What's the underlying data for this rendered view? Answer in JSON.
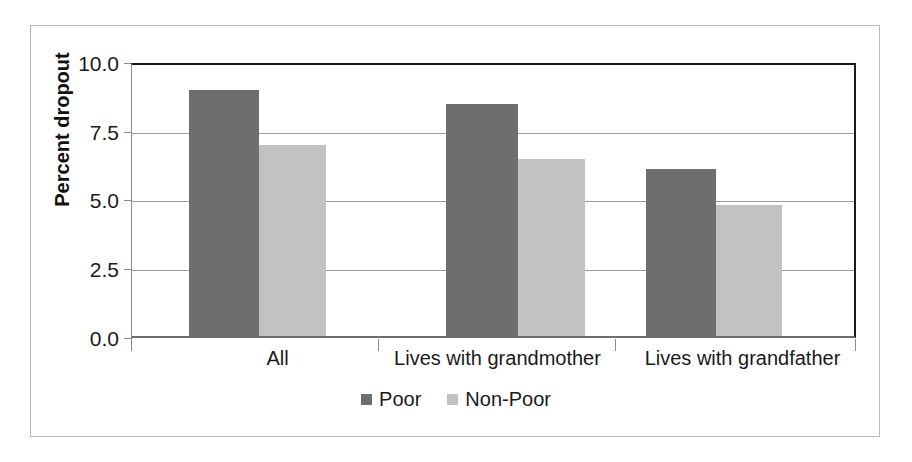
{
  "chart_data": {
    "type": "bar",
    "title": "",
    "xlabel": "",
    "ylabel": "Percent dropout",
    "categories": [
      "All",
      "Lives with grandmother",
      "Lives with grandfather"
    ],
    "series": [
      {
        "name": "Poor",
        "color": "#6e6e6e",
        "values": [
          9.0,
          8.5,
          6.1
        ]
      },
      {
        "name": "Non-Poor",
        "color": "#c2c2c2",
        "values": [
          7.0,
          6.5,
          4.8
        ]
      }
    ],
    "ylim": [
      0.0,
      10.0
    ],
    "ytick_labels": [
      "10.0",
      "7.5",
      "5.0",
      "2.5",
      "0.0"
    ],
    "ytick_values": [
      10.0,
      7.5,
      5.0,
      2.5,
      0.0
    ],
    "grid": true,
    "legend_position": "bottom-center"
  },
  "colors": {
    "poor": "#6e6e6e",
    "non_poor": "#c2c2c2",
    "grid": "#9a9a9a",
    "axis": "#1a1a1a",
    "frame": "#b9b9b9",
    "background": "#ffffff"
  }
}
